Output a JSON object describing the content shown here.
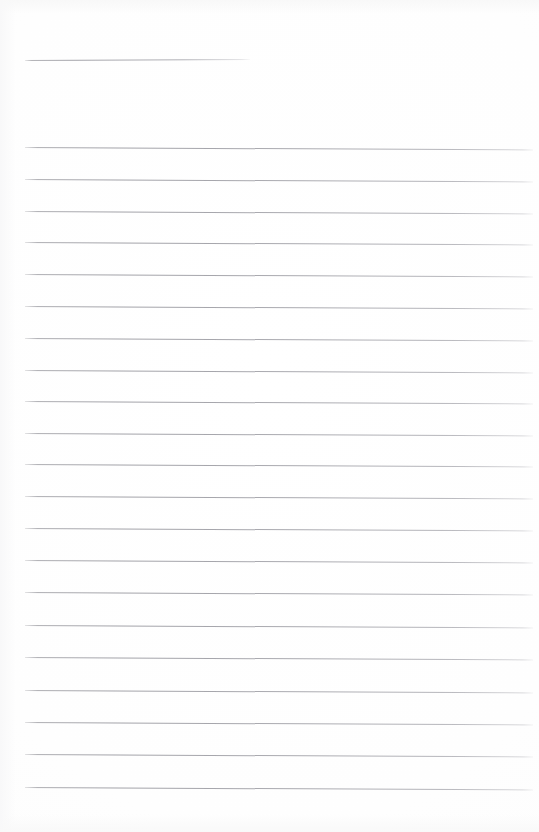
{
  "document": {
    "kind": "ruled-notebook-page",
    "title": "",
    "body_text": "",
    "is_blank": true,
    "page_width": 539,
    "page_height": 832,
    "background_color": "#fefefe",
    "rule_color": "#a6a6ac",
    "rule_thickness": 1
  },
  "header_rule": {
    "name": "header-underline",
    "x": 25,
    "y": 60,
    "width": 225,
    "slant_deg": -0.25
  },
  "ruled_lines": {
    "count": 21,
    "left_margin": 25,
    "right_edge": 533,
    "width": 508,
    "first_line_y": 147,
    "line_spacing": 32,
    "slant_deg": 0.28,
    "lines": [
      {
        "index": 1,
        "y": 147
      },
      {
        "index": 2,
        "y": 179
      },
      {
        "index": 3,
        "y": 211
      },
      {
        "index": 4,
        "y": 242
      },
      {
        "index": 5,
        "y": 274
      },
      {
        "index": 6,
        "y": 306
      },
      {
        "index": 7,
        "y": 338
      },
      {
        "index": 8,
        "y": 370
      },
      {
        "index": 9,
        "y": 401
      },
      {
        "index": 10,
        "y": 433
      },
      {
        "index": 11,
        "y": 464
      },
      {
        "index": 12,
        "y": 496
      },
      {
        "index": 13,
        "y": 528
      },
      {
        "index": 14,
        "y": 560
      },
      {
        "index": 15,
        "y": 592
      },
      {
        "index": 16,
        "y": 625
      },
      {
        "index": 17,
        "y": 657
      },
      {
        "index": 18,
        "y": 690
      },
      {
        "index": 19,
        "y": 722
      },
      {
        "index": 20,
        "y": 754
      },
      {
        "index": 21,
        "y": 787
      }
    ]
  }
}
